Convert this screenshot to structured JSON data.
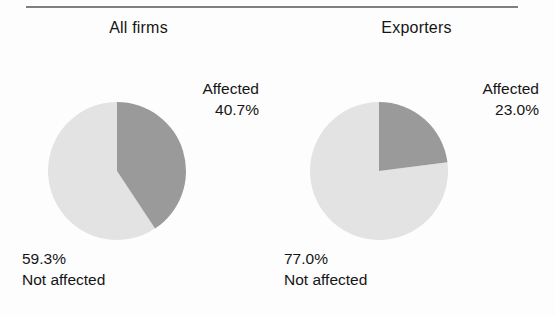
{
  "figure": {
    "background_color": "#fdfdfd",
    "rule_color": "#808080"
  },
  "chart_data": [
    {
      "type": "pie",
      "title": "All firms",
      "categories": [
        "Affected",
        "Not affected"
      ],
      "values": [
        40.7,
        59.3
      ],
      "value_labels": [
        "40.7%",
        "23.0%"
      ],
      "slices": [
        {
          "label": "Affected",
          "value": 40.7,
          "value_label": "40.7%",
          "color": "#9a9a9a"
        },
        {
          "label": "Not affected",
          "value": 59.3,
          "value_label": "59.3%",
          "color": "#e3e3e3"
        }
      ],
      "units": "percent",
      "start_angle": 0,
      "direction": "clockwise",
      "legend": "none",
      "grid": false,
      "xlabel": "",
      "ylabel": ""
    },
    {
      "type": "pie",
      "title": "Exporters",
      "categories": [
        "Affected",
        "Not affected"
      ],
      "values": [
        23.0,
        77.0
      ],
      "slices": [
        {
          "label": "Affected",
          "value": 23.0,
          "value_label": "23.0%",
          "color": "#9a9a9a"
        },
        {
          "label": "Not affected",
          "value": 77.0,
          "value_label": "77.0%",
          "color": "#e3e3e3"
        }
      ],
      "units": "percent",
      "start_angle": 0,
      "direction": "clockwise",
      "legend": "none",
      "grid": false,
      "xlabel": "",
      "ylabel": ""
    }
  ],
  "panels": {
    "all_firms": {
      "title": "All firms",
      "affected": {
        "label": "Affected",
        "percent": "40.7%"
      },
      "not_affected": {
        "label": "Not affected",
        "percent": "59.3%"
      }
    },
    "exporters": {
      "title": "Exporters",
      "affected": {
        "label": "Affected",
        "percent": "23.0%"
      },
      "not_affected": {
        "label": "Not affected",
        "percent": "77.0%"
      }
    }
  }
}
